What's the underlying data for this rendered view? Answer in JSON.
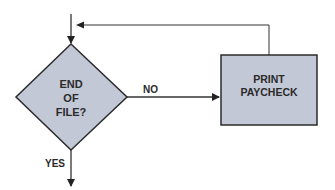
{
  "flowchart": {
    "decision": {
      "lines": [
        "END",
        "OF",
        "FILE?"
      ],
      "fill": "#c3c8d6"
    },
    "process": {
      "lines": [
        "PRINT",
        "PAYCHECK"
      ],
      "fill": "#c3c8d6"
    },
    "edges": {
      "no_label": "NO",
      "yes_label": "YES"
    },
    "line_color": "#333333"
  }
}
